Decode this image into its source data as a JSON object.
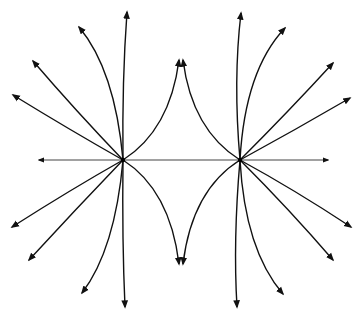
{
  "diagram": {
    "colors": {
      "line": "#111111",
      "axis": "#444444",
      "background": "#ffffff"
    },
    "charges": [
      {
        "id": "left-charge",
        "x": 123,
        "y": 160
      },
      {
        "id": "right-charge",
        "x": 240,
        "y": 160
      }
    ],
    "axis_line": {
      "x1": 39,
      "y1": 160,
      "x2": 328,
      "y2": 160
    },
    "field_lines": [
      {
        "id": "left-up-straight-far",
        "d": "M123,160 Q70,130 13,95"
      },
      {
        "id": "left-up-diag",
        "d": "M123,160 Q75,110 33,61"
      },
      {
        "id": "left-up-curve",
        "d": "M123,160 Q115,70 79,27"
      },
      {
        "id": "left-up-vertical",
        "d": "M123,160 Q122,80 127,12"
      },
      {
        "id": "left-to-top-cusp",
        "d": "M123,160 Q170,130 179,60"
      },
      {
        "id": "left-down-straight-far",
        "d": "M123,160 Q70,190 12,227"
      },
      {
        "id": "left-down-diag",
        "d": "M123,160 Q75,210 29,260"
      },
      {
        "id": "left-down-curve",
        "d": "M123,160 Q115,250 82,293"
      },
      {
        "id": "left-down-vertical",
        "d": "M123,160 Q122,240 125,307"
      },
      {
        "id": "left-to-bottom-cusp",
        "d": "M123,160 Q170,190 179,264"
      },
      {
        "id": "right-up-straight-far",
        "d": "M240,160 Q295,130 350,98"
      },
      {
        "id": "right-up-diag",
        "d": "M240,160 Q290,110 333,63"
      },
      {
        "id": "right-up-curve",
        "d": "M240,160 Q245,70 285,28"
      },
      {
        "id": "right-up-vertical",
        "d": "M240,160 Q233,80 241,13"
      },
      {
        "id": "right-to-top-cusp",
        "d": "M240,160 Q192,130 183,60"
      },
      {
        "id": "right-down-straight-far",
        "d": "M240,160 Q295,190 351,227"
      },
      {
        "id": "right-down-diag",
        "d": "M240,160 Q290,210 333,260"
      },
      {
        "id": "right-down-curve",
        "d": "M240,160 Q245,250 283,294"
      },
      {
        "id": "right-down-vertical",
        "d": "M240,160 Q233,240 237,307"
      },
      {
        "id": "right-to-bottom-cusp",
        "d": "M240,160 Q192,190 183,264"
      }
    ]
  }
}
